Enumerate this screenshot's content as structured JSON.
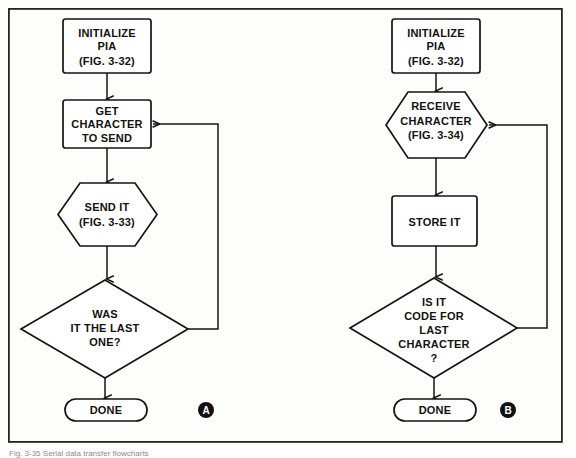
{
  "figure": {
    "type": "flowchart",
    "panel_count": 2,
    "caption_partial": "Fig. 3-35 Serial data transfer flowcharts",
    "frame": {
      "x": 8,
      "y": 8,
      "width": 555,
      "height": 435
    }
  },
  "panels": [
    {
      "id": "A",
      "badge_label": "A",
      "title": "Transmit character sequence",
      "badge": {
        "cx": 206,
        "cy": 410,
        "r": 8
      },
      "nodes": [
        {
          "name": "initialize-pia",
          "shape": "process",
          "lines": [
            "INITIALIZE",
            "PIA",
            "(FIG. 3-32)"
          ],
          "box": {
            "x": 63,
            "y": 19,
            "width": 88,
            "height": 54
          }
        },
        {
          "name": "get-character-to-send",
          "shape": "process",
          "lines": [
            "GET",
            "CHARACTER",
            "TO SEND"
          ],
          "box": {
            "x": 63,
            "y": 100,
            "width": 88,
            "height": 48
          }
        },
        {
          "name": "send-it",
          "shape": "hexagon",
          "lines": [
            "SEND IT",
            "(FIG. 3-33)"
          ],
          "box": {
            "x": 58,
            "y": 183,
            "width": 99,
            "height": 63
          }
        },
        {
          "name": "was-it-the-last-one",
          "shape": "decision",
          "lines": [
            "WAS",
            "IT THE LAST",
            "ONE?"
          ],
          "box": {
            "x": 21,
            "y": 280,
            "width": 167,
            "height": 98
          }
        },
        {
          "name": "done",
          "shape": "terminator",
          "lines": [
            "DONE"
          ],
          "box": {
            "x": 65,
            "y": 399,
            "width": 82,
            "height": 22
          }
        }
      ],
      "edges": [
        {
          "name": "edge-initialize-to-get",
          "from": "initialize-pia",
          "to": "get-character-to-send",
          "kind": "arrow-down"
        },
        {
          "name": "edge-get-to-send",
          "from": "get-character-to-send",
          "to": "send-it",
          "kind": "arrow-down"
        },
        {
          "name": "edge-send-to-decision",
          "from": "send-it",
          "to": "was-it-the-last-one",
          "kind": "arrow-down"
        },
        {
          "name": "edge-decision-to-done",
          "from": "was-it-the-last-one",
          "to": "done",
          "kind": "arrow-down"
        },
        {
          "name": "edge-loop-back-to-get",
          "from": "was-it-the-last-one",
          "to": "get-character-to-send",
          "kind": "feedback-loop-left-arrow"
        }
      ]
    },
    {
      "id": "B",
      "badge_label": "B",
      "title": "Receive character sequence",
      "badge": {
        "cx": 508,
        "cy": 410,
        "r": 8
      },
      "nodes": [
        {
          "name": "initialize-pia",
          "shape": "process",
          "lines": [
            "INITIALIZE",
            "PIA",
            "(FIG. 3-32)"
          ],
          "box": {
            "x": 392,
            "y": 19,
            "width": 88,
            "height": 54
          }
        },
        {
          "name": "receive-character",
          "shape": "hexagon",
          "lines": [
            "RECEIVE",
            "CHARACTER",
            "(FIG. 3-34)"
          ],
          "box": {
            "x": 386,
            "y": 92,
            "width": 101,
            "height": 66
          }
        },
        {
          "name": "store-it",
          "shape": "process",
          "lines": [
            "STORE IT"
          ],
          "box": {
            "x": 392,
            "y": 196,
            "width": 85,
            "height": 50
          }
        },
        {
          "name": "is-it-code-for-last-character",
          "shape": "decision",
          "lines": [
            "IS IT",
            "CODE FOR",
            "LAST",
            "CHARACTER",
            "?"
          ],
          "box": {
            "x": 350,
            "y": 278,
            "width": 167,
            "height": 100
          }
        },
        {
          "name": "done",
          "shape": "terminator",
          "lines": [
            "DONE"
          ],
          "box": {
            "x": 394,
            "y": 399,
            "width": 82,
            "height": 22
          }
        }
      ],
      "edges": [
        {
          "name": "edge-initialize-to-receive",
          "from": "initialize-pia",
          "to": "receive-character",
          "kind": "arrow-down"
        },
        {
          "name": "edge-receive-to-store",
          "from": "receive-character",
          "to": "store-it",
          "kind": "arrow-down"
        },
        {
          "name": "edge-store-to-decision",
          "from": "store-it",
          "to": "is-it-code-for-last-character",
          "kind": "arrow-down"
        },
        {
          "name": "edge-decision-to-done",
          "from": "is-it-code-for-last-character",
          "to": "done",
          "kind": "arrow-down"
        },
        {
          "name": "edge-loop-back-to-receive",
          "from": "is-it-code-for-last-character",
          "to": "receive-character",
          "kind": "feedback-loop-left-arrow"
        }
      ]
    }
  ],
  "colors": {
    "ink": "#17150f",
    "paper": "#fdfdfc",
    "badge_fill": "#111111",
    "badge_text": "#ffffff",
    "frame": "#26241f"
  }
}
